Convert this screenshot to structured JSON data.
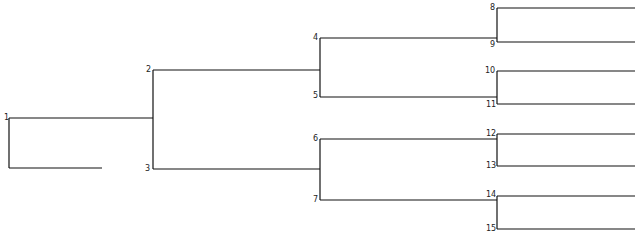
{
  "diagram": {
    "type": "tournament-bracket",
    "line_color": "#111111",
    "nodes": [
      {
        "id": "1",
        "label": "1"
      },
      {
        "id": "2",
        "label": "2"
      },
      {
        "id": "3",
        "label": "3"
      },
      {
        "id": "4",
        "label": "4"
      },
      {
        "id": "5",
        "label": "5"
      },
      {
        "id": "6",
        "label": "6"
      },
      {
        "id": "7",
        "label": "7"
      },
      {
        "id": "8",
        "label": "8"
      },
      {
        "id": "9",
        "label": "9"
      },
      {
        "id": "10",
        "label": "10"
      },
      {
        "id": "11",
        "label": "11"
      },
      {
        "id": "12",
        "label": "12"
      },
      {
        "id": "13",
        "label": "13"
      },
      {
        "id": "14",
        "label": "14"
      },
      {
        "id": "15",
        "label": "15"
      }
    ],
    "edges": [
      [
        "1",
        "2"
      ],
      [
        "1",
        "3"
      ],
      [
        "2",
        "4"
      ],
      [
        "2",
        "5"
      ],
      [
        "3",
        "6"
      ],
      [
        "3",
        "7"
      ],
      [
        "4",
        "8"
      ],
      [
        "4",
        "9"
      ],
      [
        "5",
        "10"
      ],
      [
        "5",
        "11"
      ],
      [
        "6",
        "12"
      ],
      [
        "6",
        "13"
      ],
      [
        "7",
        "14"
      ],
      [
        "7",
        "15"
      ]
    ]
  }
}
